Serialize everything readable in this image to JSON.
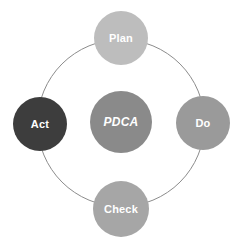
{
  "diagram": {
    "title": "PDCA",
    "ring": {
      "cx": 121,
      "cy": 123,
      "r": 84,
      "color": "#8c8c8c"
    },
    "center": {
      "label": "PDCA",
      "cx": 121,
      "cy": 122,
      "r": 31,
      "color": "#8a8a8a"
    },
    "nodes": [
      {
        "id": "plan",
        "label": "Plan",
        "position": "top",
        "cx": 121,
        "cy": 38,
        "r": 27,
        "color": "#bdbdbd"
      },
      {
        "id": "do",
        "label": "Do",
        "position": "right",
        "cx": 203,
        "cy": 123,
        "r": 27,
        "color": "#9a9a9a"
      },
      {
        "id": "check",
        "label": "Check",
        "position": "bottom",
        "cx": 121,
        "cy": 209,
        "r": 28,
        "color": "#a6a6a6"
      },
      {
        "id": "act",
        "label": "Act",
        "position": "left",
        "cx": 40,
        "cy": 124,
        "r": 27,
        "color": "#3d3d3d"
      }
    ],
    "cycle_order": [
      "Plan",
      "Do",
      "Check",
      "Act"
    ]
  }
}
